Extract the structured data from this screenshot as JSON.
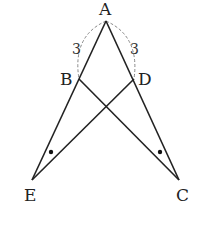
{
  "diagram": {
    "type": "geometry",
    "points": {
      "A": {
        "label": "A",
        "x": 106,
        "y": 21
      },
      "B": {
        "label": "B",
        "x": 79,
        "y": 79
      },
      "D": {
        "label": "D",
        "x": 134,
        "y": 79
      },
      "E": {
        "label": "E",
        "x": 32,
        "y": 180
      },
      "C": {
        "label": "C",
        "x": 179,
        "y": 180
      }
    },
    "segments": [
      "A-E",
      "A-C",
      "B-C",
      "D-E"
    ],
    "lengths": [
      {
        "between": "A-B",
        "label": "3"
      },
      {
        "between": "A-D",
        "label": "3"
      }
    ],
    "equal_angle_marks": [
      "angle AEB (at E)",
      "angle ACD (at C)"
    ],
    "colors": {
      "line": "#222222",
      "dashed": "#888888",
      "background": "#ffffff"
    }
  }
}
